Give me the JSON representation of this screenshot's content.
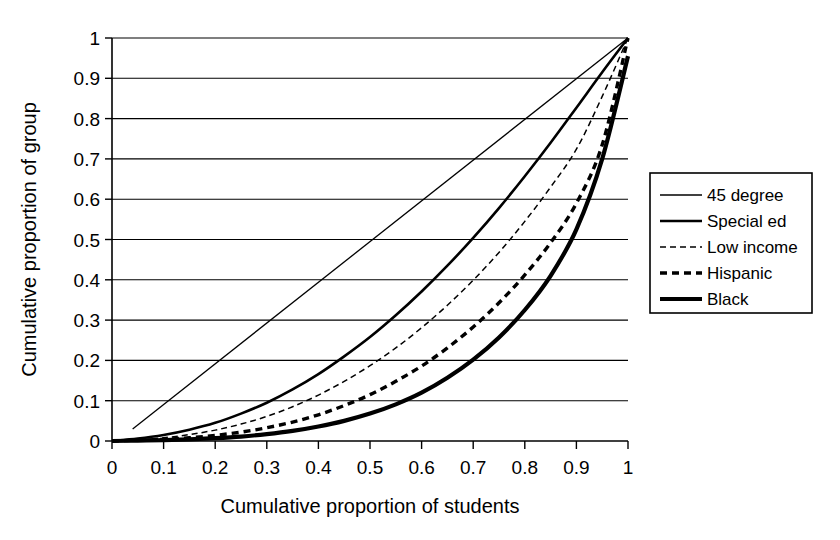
{
  "chart_data": {
    "type": "line",
    "title": "",
    "xlabel": "Cumulative proportion of students",
    "ylabel": "Cumulative proportion of group",
    "xlim": [
      0,
      1
    ],
    "ylim": [
      0,
      1
    ],
    "xticks": [
      "0",
      "0.1",
      "0.2",
      "0.3",
      "0.4",
      "0.5",
      "0.6",
      "0.7",
      "0.8",
      "0.9",
      "1"
    ],
    "yticks": [
      "0",
      "0.1",
      "0.2",
      "0.3",
      "0.4",
      "0.5",
      "0.6",
      "0.7",
      "0.8",
      "0.9",
      "1"
    ],
    "xtick_values": [
      0,
      0.1,
      0.2,
      0.3,
      0.4,
      0.5,
      0.6,
      0.7,
      0.8,
      0.9,
      1
    ],
    "ytick_values": [
      0,
      0.1,
      0.2,
      0.3,
      0.4,
      0.5,
      0.6,
      0.7,
      0.8,
      0.9,
      1
    ],
    "grid": "horizontal",
    "legend_position": "right-outside",
    "x": [
      0,
      0.05,
      0.1,
      0.15,
      0.2,
      0.25,
      0.3,
      0.35,
      0.4,
      0.45,
      0.5,
      0.55,
      0.6,
      0.65,
      0.7,
      0.75,
      0.8,
      0.85,
      0.9,
      0.95,
      1
    ],
    "series": [
      {
        "name": "45 degree",
        "style": "thin-solid",
        "stroke_width": 1.3,
        "dash": "",
        "color": "#000000",
        "x": [
          0.04,
          1
        ],
        "values": [
          0.03,
          1
        ]
      },
      {
        "name": "Special ed",
        "style": "medium-solid",
        "stroke_width": 2.6,
        "dash": "",
        "color": "#000000",
        "values": [
          0,
          0.006,
          0.015,
          0.028,
          0.045,
          0.068,
          0.095,
          0.128,
          0.166,
          0.21,
          0.258,
          0.312,
          0.371,
          0.435,
          0.504,
          0.578,
          0.657,
          0.74,
          0.827,
          0.915,
          1
        ]
      },
      {
        "name": "Low income",
        "style": "fine-dashed",
        "stroke_width": 1.5,
        "dash": "6,4",
        "color": "#000000",
        "values": [
          0,
          0.003,
          0.008,
          0.016,
          0.027,
          0.042,
          0.061,
          0.085,
          0.114,
          0.148,
          0.187,
          0.231,
          0.281,
          0.337,
          0.399,
          0.468,
          0.545,
          0.63,
          0.724,
          0.855,
          1
        ]
      },
      {
        "name": "Hispanic",
        "style": "bold-dash-dot",
        "stroke_width": 3.4,
        "dash": "7,5",
        "color": "#000000",
        "values": [
          0,
          0.002,
          0.004,
          0.008,
          0.014,
          0.022,
          0.033,
          0.047,
          0.065,
          0.088,
          0.115,
          0.148,
          0.186,
          0.231,
          0.283,
          0.343,
          0.412,
          0.492,
          0.59,
          0.735,
          1
        ]
      },
      {
        "name": "Black",
        "style": "thick-solid",
        "stroke_width": 4.2,
        "dash": "",
        "color": "#000000",
        "values": [
          0,
          0.001,
          0.002,
          0.004,
          0.007,
          0.011,
          0.017,
          0.025,
          0.036,
          0.05,
          0.068,
          0.091,
          0.12,
          0.157,
          0.202,
          0.257,
          0.325,
          0.41,
          0.525,
          0.7,
          0.955
        ]
      }
    ]
  },
  "legend": {
    "items": [
      {
        "label": "45 degree"
      },
      {
        "label": "Special ed"
      },
      {
        "label": "Low income"
      },
      {
        "label": "Hispanic"
      },
      {
        "label": "Black"
      }
    ]
  }
}
